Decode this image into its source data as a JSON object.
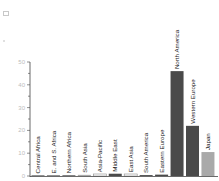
{
  "chart_data": {
    "type": "bar",
    "title": "",
    "xlabel": "",
    "ylabel": "",
    "ylim": [
      0,
      50
    ],
    "yticks": [
      0,
      10,
      20,
      30,
      40,
      50
    ],
    "grid": false,
    "legend": null,
    "categories": [
      "Central Africa",
      "E. and S. Africa",
      "Northern Africa",
      "South Asia",
      "Asia-Pacific",
      "Middle East",
      "East Asia",
      "South America",
      "Eastern Europe",
      "North America",
      "Western Europe",
      "Japan"
    ],
    "values": [
      0.1,
      0.1,
      0.3,
      0.5,
      0.8,
      1.0,
      0.8,
      0.4,
      0.6,
      46,
      22,
      10.5
    ],
    "bar_styles": [
      "dark",
      "dark",
      "dark",
      "light",
      "outline",
      "dark",
      "outline",
      "dark",
      "dark",
      "dark",
      "dark",
      "light"
    ]
  },
  "colors": {
    "dark": "#4a4a4a",
    "light": "#a9a9a9",
    "outline_fill": "#ffffff",
    "outline_stroke": "#8a8a8a",
    "axis": "#444444",
    "tick_text": "#bdbdbd"
  }
}
